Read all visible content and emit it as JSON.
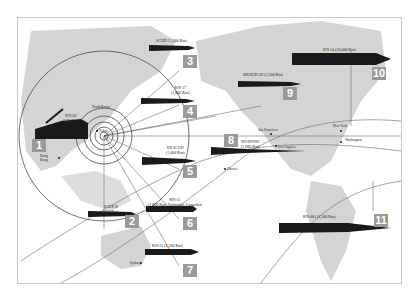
{
  "map": {
    "colors": {
      "land": "#d4d4d4",
      "missile": "#1a1a1a",
      "badge": "#9a9a9a",
      "line": "#6a6a6a",
      "frame": "#c8c8c8"
    },
    "origin_label": "North Korea",
    "cities": [
      {
        "name": "Tokyo",
        "x": 96,
        "y": 130
      },
      {
        "name": "Hong Kong",
        "x": 58,
        "y": 157
      },
      {
        "name": "Sydney",
        "x": 140,
        "y": 262
      },
      {
        "name": "Hawaii",
        "x": 224,
        "y": 168
      },
      {
        "name": "San Francisco",
        "x": 270,
        "y": 133
      },
      {
        "name": "Los Angeles",
        "x": 275,
        "y": 145
      },
      {
        "name": "New York",
        "x": 340,
        "y": 130
      },
      {
        "name": "Washington",
        "x": 340,
        "y": 141
      }
    ],
    "missiles": [
      {
        "num": "1",
        "name": "KN-02",
        "range": "(120 Km)"
      },
      {
        "num": "2",
        "name": "SCUD B",
        "range": "(300 Km)"
      },
      {
        "num": "3",
        "name": "SCUD C",
        "range": "(500 Km)"
      },
      {
        "num": "4",
        "name": "KN-17",
        "range": "(1,000 Km)"
      },
      {
        "num": "5",
        "name": "ER SCUD",
        "range": "(1,000 Km)"
      },
      {
        "num": "6",
        "name": "KN-11",
        "range": "(1,000 Km) Submarine Launched"
      },
      {
        "num": "7",
        "name": "KN-15",
        "range": "(1,200 Km)"
      },
      {
        "num": "8",
        "name": "NO-DONG",
        "range": "(1,800 Km)"
      },
      {
        "num": "9",
        "name": "MUSUDAN",
        "range": "(3,500 Km)"
      },
      {
        "num": "10",
        "name": "KN-14",
        "range": "(10,000 Km)"
      },
      {
        "num": "11",
        "name": "KN-08",
        "range": "(11,500 Km)"
      }
    ]
  }
}
